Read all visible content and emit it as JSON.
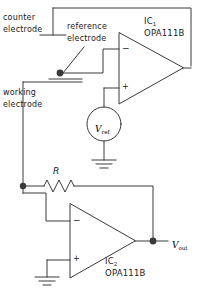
{
  "diagram": {
    "stroke_color": "#3a3a3a",
    "text_color": "#1a1a1a",
    "background": "#ffffff",
    "labels": {
      "counter_electrode_line1": "counter",
      "counter_electrode_line2": "electrode",
      "reference_electrode_line1": "reference",
      "reference_electrode_line2": "electrode",
      "working_electrode_line1": "working",
      "working_electrode_line2": "electrode",
      "ic1_name": "IC",
      "ic1_index": "1",
      "ic1_part": "OPA111B",
      "ic2_name": "IC",
      "ic2_index": "2",
      "ic2_part": "OPA111B",
      "vref_symbol": "V",
      "vref_subscript": "ref",
      "vout_symbol": "V",
      "vout_subscript": "out",
      "resistor_label": "R",
      "opamp1_minus": "−",
      "opamp1_plus": "+",
      "opamp2_minus": "−",
      "opamp2_plus": "+"
    },
    "components": [
      {
        "name": "op-amp-ic1",
        "type": "operational-amplifier",
        "part": "OPA111B",
        "designator": "IC1"
      },
      {
        "name": "op-amp-ic2",
        "type": "operational-amplifier",
        "part": "OPA111B",
        "designator": "IC2"
      },
      {
        "name": "voltage-source-vref",
        "type": "voltage-source",
        "label": "Vref"
      },
      {
        "name": "resistor-r",
        "type": "resistor",
        "label": "R"
      },
      {
        "name": "ground-vref",
        "type": "ground"
      },
      {
        "name": "ground-ic2-plus",
        "type": "ground"
      },
      {
        "name": "electrode-counter",
        "type": "electrode",
        "label": "counter electrode"
      },
      {
        "name": "electrode-reference",
        "type": "electrode",
        "label": "reference electrode"
      },
      {
        "name": "electrode-working",
        "type": "electrode",
        "label": "working electrode"
      }
    ]
  }
}
